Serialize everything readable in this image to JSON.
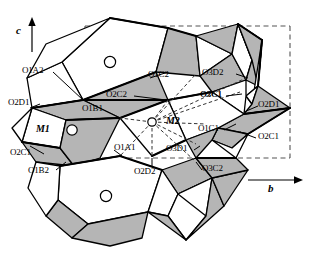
{
  "figure": {
    "kind": "crystal-structure-polyhedral-diagram",
    "background": "#ffffff",
    "width": 333,
    "height": 256,
    "colors": {
      "outline": "#000000",
      "face_shaded": "#b5b5b5",
      "face_light": "#ffffff",
      "unit_cell_dash": "#555555",
      "bond_dash": "#333333"
    }
  },
  "axes": {
    "c_label": "c",
    "b_label": "b"
  },
  "sites": {
    "m1_label": "M1",
    "m2_label": "M2"
  },
  "oxygen_labels": {
    "o1a2": "O1A2",
    "o2d1_left": "O2D1",
    "o2c1_left": "O2C1",
    "o1b2": "O1B2",
    "o1a1": "O1A1",
    "o2d2": "O2D2",
    "o1b1": "O1B1",
    "o2c2": "O2C2",
    "o1c2": "O1C2",
    "o3d2": "O3D2",
    "o3c1": "O3C1",
    "o2d1_right": "O2D1",
    "o1c1": "O1C1",
    "o2c1_right": "O2C1",
    "o3d1": "O3D1",
    "o3c2": "O3C2"
  }
}
